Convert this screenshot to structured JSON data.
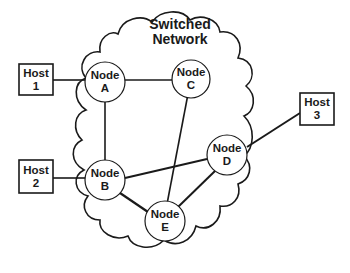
{
  "diagram": {
    "title_line1": "Switched",
    "title_line2": "Network",
    "nodes": [
      {
        "id": "A",
        "line1": "Node",
        "line2": "A"
      },
      {
        "id": "B",
        "line1": "Node",
        "line2": "B"
      },
      {
        "id": "C",
        "line1": "Node",
        "line2": "C"
      },
      {
        "id": "D",
        "line1": "Node",
        "line2": "D"
      },
      {
        "id": "E",
        "line1": "Node",
        "line2": "E"
      }
    ],
    "hosts": [
      {
        "id": "1",
        "line1": "Host",
        "line2": "1"
      },
      {
        "id": "2",
        "line1": "Host",
        "line2": "2"
      },
      {
        "id": "3",
        "line1": "Host",
        "line2": "3"
      }
    ],
    "links": [
      [
        "Host 1",
        "Node A"
      ],
      [
        "Host 2",
        "Node B"
      ],
      [
        "Host 3",
        "Node D"
      ],
      [
        "Node A",
        "Node C"
      ],
      [
        "Node A",
        "Node B"
      ],
      [
        "Node B",
        "Node D"
      ],
      [
        "Node B",
        "Node E"
      ],
      [
        "Node C",
        "Node E"
      ],
      [
        "Node D",
        "Node E"
      ]
    ],
    "colors": {
      "stroke": "#1a1a1a",
      "background": "#ffffff"
    }
  }
}
